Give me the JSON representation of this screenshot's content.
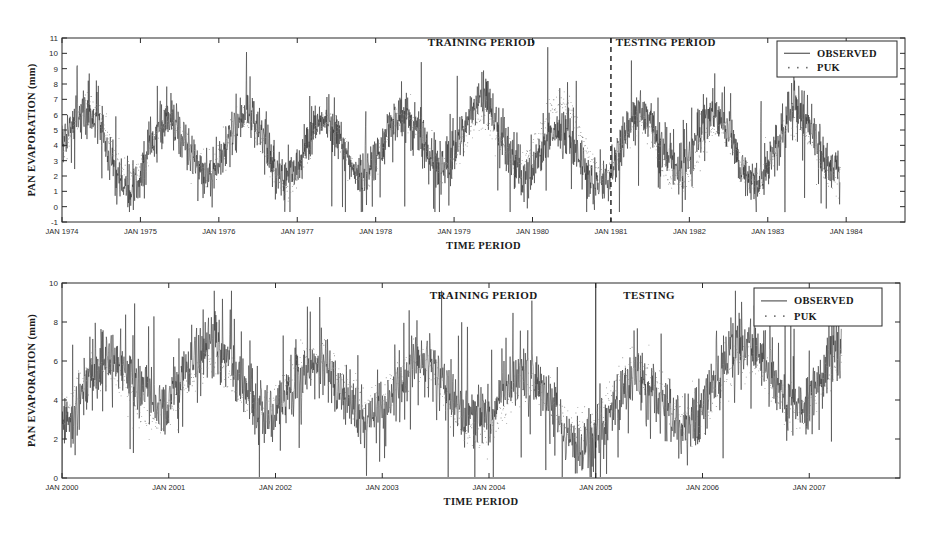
{
  "figure": {
    "width": 930,
    "height": 533,
    "background": "#ffffff",
    "ink_color": "#2e2e2e",
    "puk_color": "#8a8a8a"
  },
  "chart_data": [
    {
      "id": "top",
      "type": "line",
      "title": "",
      "xlabel": "TIME PERIOD",
      "ylabel": "PAN EVAPORATION (mm)",
      "ylim": [
        -1,
        11
      ],
      "yticks": [
        -1,
        0,
        1,
        2,
        3,
        4,
        5,
        6,
        7,
        8,
        9,
        10,
        11
      ],
      "ytick_labels": [
        "-1",
        "0",
        "1",
        "2",
        "3",
        "4",
        "5",
        "6",
        "7",
        "8",
        "9",
        "10",
        "11"
      ],
      "xlim": [
        1974.0,
        1984.75
      ],
      "xticks": [
        1974,
        1975,
        1976,
        1977,
        1978,
        1979,
        1980,
        1981,
        1982,
        1983,
        1984
      ],
      "xtick_labels": [
        "JAN 1974",
        "JAN 1975",
        "JAN 1976",
        "JAN 1977",
        "JAN 1978",
        "JAN 1979",
        "JAN 1980",
        "JAN 1981",
        "JAN 1982",
        "JAN 1983",
        "JAN 1984"
      ],
      "grid": false,
      "legend_position": "top-right",
      "series": [
        {
          "name": "OBSERVED",
          "marker": "line",
          "color": "#2e2e2e",
          "seed": 11,
          "baseline": 4.05,
          "amplitude": 1.95,
          "phase": 0.02,
          "noise": 1.05,
          "spike": 0.12,
          "x_start": 1974.0,
          "x_end": 1983.92,
          "samples": 2400,
          "ymin": -0.35,
          "ymax": 10.4
        },
        {
          "name": "PUK",
          "marker": "dot",
          "color": "#8a8a8a",
          "seed": 47,
          "baseline": 4.05,
          "amplitude": 1.9,
          "phase": 0.02,
          "noise": 0.62,
          "spike": 0.04,
          "x_start": 1974.0,
          "x_end": 1983.92,
          "samples": 1500,
          "ymin": 0.3,
          "ymax": 9.1
        }
      ],
      "annotations": [
        {
          "text": "TRAINING PERIOD",
          "x": 1979.35,
          "y": 10.45
        },
        {
          "text": "TESTING PERIOD",
          "x": 1981.7,
          "y": 10.45
        }
      ],
      "dividers": [
        {
          "x": 1981.0,
          "style": "dashed"
        }
      ]
    },
    {
      "id": "bottom",
      "type": "line",
      "title": "",
      "xlabel": "TIME PERIOD",
      "ylabel": "PAN EVAPORATION (mm)",
      "ylim": [
        0,
        10
      ],
      "yticks": [
        0,
        2,
        4,
        6,
        8,
        10
      ],
      "ytick_labels": [
        "0",
        "2",
        "4",
        "6",
        "8",
        "10"
      ],
      "xlim": [
        2000.0,
        2007.85
      ],
      "xticks": [
        2000,
        2001,
        2002,
        2003,
        2004,
        2005,
        2006,
        2007
      ],
      "xtick_labels": [
        "JAN 2000",
        "JAN 2001",
        "JAN 2002",
        "JAN 2003",
        "JAN 2004",
        "JAN 2005",
        "JAN 2006",
        "JAN 2007"
      ],
      "grid": false,
      "legend_position": "top-right",
      "series": [
        {
          "name": "OBSERVED",
          "marker": "line",
          "color": "#2e2e2e",
          "seed": 29,
          "baseline": 4.4,
          "amplitude": 1.45,
          "phase": 0.05,
          "noise": 1.15,
          "spike": 0.11,
          "x_start": 2000.0,
          "x_end": 2007.3,
          "samples": 1900,
          "ymin": 0.05,
          "ymax": 9.6
        },
        {
          "name": "PUK",
          "marker": "dot",
          "color": "#8a8a8a",
          "seed": 73,
          "baseline": 4.4,
          "amplitude": 1.4,
          "phase": 0.05,
          "noise": 0.7,
          "spike": 0.035,
          "x_start": 2000.0,
          "x_end": 2007.3,
          "samples": 1250,
          "ymin": 0.5,
          "ymax": 8.4
        }
      ],
      "annotations": [
        {
          "text": "TRAINING PERIOD",
          "x": 2003.95,
          "y": 9.2
        },
        {
          "text": "TESTING",
          "x": 2005.5,
          "y": 9.2
        }
      ],
      "dividers": [
        {
          "x": 2005.0,
          "style": "solid"
        }
      ]
    }
  ],
  "panels": [
    {
      "name": "top-panel",
      "legend": {
        "entries": [
          {
            "label": "OBSERVED",
            "style": "line"
          },
          {
            "label": "PUK",
            "style": "dot"
          }
        ]
      }
    },
    {
      "name": "bottom-panel",
      "legend": {
        "entries": [
          {
            "label": "OBSERVED",
            "style": "line"
          },
          {
            "label": "PUK",
            "style": "dot"
          }
        ]
      }
    }
  ]
}
